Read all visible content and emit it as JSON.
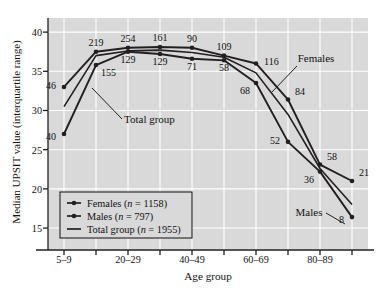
{
  "chart_data": {
    "type": "line",
    "title": "",
    "xlabel": "Age group",
    "ylabel": "Median UPSIT value (interquartile range)",
    "xtick_labels": [
      "5–9",
      "20–29",
      "40–49",
      "60–69",
      "80–89"
    ],
    "xtick_positions": [
      0,
      2,
      4,
      6,
      8
    ],
    "x_categories": [
      "5–9",
      "10–19",
      "20–29",
      "30–39",
      "40–49",
      "50–59",
      "60–69",
      "70–79",
      "80–89",
      "90–99"
    ],
    "ytick_labels": [
      "40",
      "35",
      "30",
      "25",
      "20",
      "15"
    ],
    "ytick_values": [
      40,
      35,
      30,
      25,
      20,
      15
    ],
    "ylim": [
      12.2,
      41.8
    ],
    "grid": true,
    "legend_position": "lower-left",
    "series": [
      {
        "name": "Females",
        "legend_label": "Females (n = 1158)",
        "n": 1158,
        "marker": "circle",
        "values": [
          33.0,
          37.5,
          38.0,
          38.1,
          38.0,
          37.0,
          36.0,
          31.4,
          23.1,
          21.0
        ],
        "point_labels": [
          "46",
          "219",
          "254",
          "161",
          "90",
          "109",
          "116",
          "84",
          "58",
          "21"
        ],
        "label_positions": [
          "left",
          "above",
          "above",
          "above",
          "above",
          "above",
          "right",
          "above-right",
          "above-right",
          "above-right"
        ]
      },
      {
        "name": "Males",
        "legend_label": "Males (n = 797)",
        "n": 797,
        "marker": "circle",
        "values": [
          27.0,
          35.8,
          37.5,
          37.2,
          36.6,
          36.4,
          33.5,
          26.0,
          22.2,
          16.4
        ],
        "point_labels": [
          "40",
          "155",
          "129",
          "129",
          "71",
          "58",
          "68",
          "52",
          "36",
          "8"
        ],
        "label_positions": [
          "left-below",
          "below-right",
          "below",
          "below",
          "below",
          "below",
          "below-left",
          "left",
          "below-left",
          "left-below"
        ]
      },
      {
        "name": "Total group",
        "legend_label": "Total group (n = 1955)",
        "n": 1955,
        "marker": "none",
        "values": [
          30.5,
          37.0,
          37.6,
          37.7,
          37.4,
          36.8,
          34.8,
          29.5,
          22.6,
          18.0
        ],
        "point_labels": [],
        "label_positions": []
      }
    ],
    "annotations": [
      {
        "text": "Females",
        "target_series": "Females",
        "target_index": 7
      },
      {
        "text": "Males",
        "target_series": "Males",
        "target_index": 9
      },
      {
        "text": "Total group",
        "target_series": "Total group",
        "target_index": 0
      }
    ],
    "colors": {
      "plot_background": "#d9d9d9",
      "gridline": "#ffffff",
      "series_line": "#231f20",
      "axis": "#231f20",
      "text": "#111111",
      "legend_background": "#d9d9d9"
    }
  },
  "legend": {
    "items": [
      {
        "label": "Females (n = 1158)",
        "marker": "line-dot"
      },
      {
        "label": "Males (n = 797)",
        "marker": "line-dot"
      },
      {
        "label": "Total group (n = 1955)",
        "marker": "line"
      }
    ]
  },
  "caption": {
    "text": ""
  }
}
